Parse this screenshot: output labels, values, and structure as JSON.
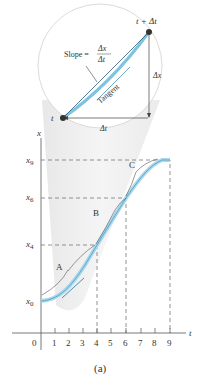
{
  "figure": {
    "caption": "(a)",
    "inset": {
      "point_start": "t",
      "point_end": "t + Δt",
      "slope_label": "Slope =",
      "slope_num": "Δx",
      "slope_den": "Δt",
      "tangent_label": "Tangent",
      "delta_x": "Δx",
      "delta_t": "Δt"
    },
    "axes": {
      "x_axis_label": "t",
      "y_axis_label": "x",
      "x_ticks": [
        "0",
        "1",
        "2",
        "3",
        "4",
        "5",
        "6",
        "7",
        "8",
        "9"
      ],
      "y_ticks": [
        {
          "base": "x",
          "sub": "0"
        },
        {
          "base": "x",
          "sub": "4"
        },
        {
          "base": "x",
          "sub": "6"
        },
        {
          "base": "x",
          "sub": "9"
        }
      ]
    },
    "regions": [
      "A",
      "B",
      "C"
    ],
    "colors": {
      "curve": "#7ec3e0",
      "curve_dark": "#4a90b8",
      "axis": "#555555",
      "dashed": "#666666",
      "lens": "#d8d8d8"
    }
  }
}
